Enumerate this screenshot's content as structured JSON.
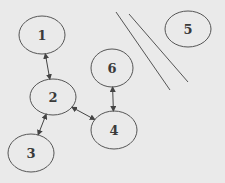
{
  "diagram": {
    "colors": {
      "background": "#eaeaea",
      "stroke": "#555555",
      "text": "#3a3a3a"
    },
    "nodes": [
      {
        "id": "1",
        "label": "1",
        "cx": 42,
        "cy": 35,
        "rx": 23,
        "ry": 19
      },
      {
        "id": "2",
        "label": "2",
        "cx": 53,
        "cy": 97,
        "rx": 23,
        "ry": 18
      },
      {
        "id": "3",
        "label": "3",
        "cx": 31,
        "cy": 153,
        "rx": 23,
        "ry": 19
      },
      {
        "id": "4",
        "label": "4",
        "cx": 114,
        "cy": 130,
        "rx": 23,
        "ry": 19
      },
      {
        "id": "5",
        "label": "5",
        "cx": 188,
        "cy": 29,
        "rx": 23,
        "ry": 18
      },
      {
        "id": "6",
        "label": "6",
        "cx": 112,
        "cy": 68,
        "rx": 21,
        "ry": 19
      }
    ],
    "edges": [
      {
        "from": "1",
        "to": "2",
        "type": "bidirectional"
      },
      {
        "from": "2",
        "to": "3",
        "type": "bidirectional"
      },
      {
        "from": "2",
        "to": "4",
        "type": "bidirectional"
      },
      {
        "from": "6",
        "to": "4",
        "type": "bidirectional"
      }
    ],
    "separator_lines": [
      {
        "x1": 116,
        "y1": 12,
        "x2": 170,
        "y2": 90
      },
      {
        "x1": 129,
        "y1": 14,
        "x2": 188,
        "y2": 82
      }
    ]
  }
}
